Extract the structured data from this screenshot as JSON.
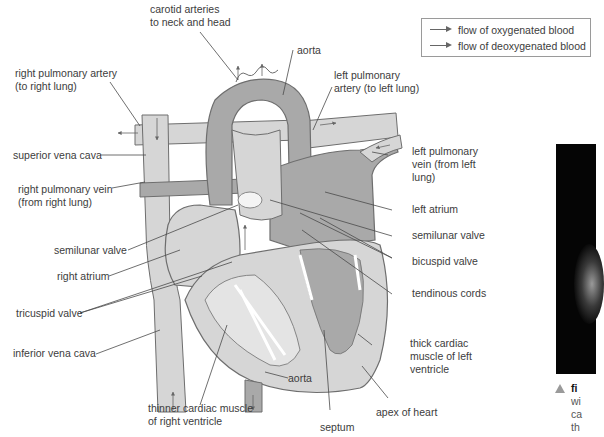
{
  "legend": {
    "items": [
      {
        "label": "flow of oxygenated blood",
        "arrow_color": "#666666"
      },
      {
        "label": "flow of deoxygenated blood",
        "arrow_color": "#666666"
      }
    ]
  },
  "labels": {
    "carotid_arteries": [
      "carotid arteries",
      "to neck and head"
    ],
    "aorta_top": "aorta",
    "right_pulmonary_artery": [
      "right pulmonary artery",
      "(to right lung)"
    ],
    "left_pulmonary_artery": [
      "left pulmonary",
      "artery (to left lung)"
    ],
    "superior_vena_cava": "superior vena cava",
    "right_pulmonary_vein": [
      "right pulmonary vein",
      "(from right lung)"
    ],
    "left_pulmonary_vein": [
      "left pulmonary",
      "vein (from left",
      "lung)"
    ],
    "left_atrium": "left atrium",
    "semilunar_valve_left": "semilunar valve",
    "semilunar_valve_right": "semilunar valve",
    "right_atrium": "right atrium",
    "bicuspid_valve": "bicuspid valve",
    "tricuspid_valve": "tricuspid valve",
    "tendinous_cords": "tendinous cords",
    "inferior_vena_cava": "inferior vena cava",
    "thick_cardiac_muscle": [
      "thick cardiac",
      "muscle of left",
      "ventricle"
    ],
    "aorta_bottom": "aorta",
    "thinner_cardiac_muscle": [
      "thinner cardiac muscle",
      "of right ventricle"
    ],
    "apex_of_heart": "apex of heart",
    "septum": "septum"
  },
  "caption": {
    "lines": [
      "fi",
      "wi",
      "ca",
      "th"
    ]
  },
  "colors": {
    "vessel_light": "#d6d6d6",
    "vessel_dark": "#a9a9a9",
    "chamber_mid": "#bfbfbf",
    "outline": "#6e6e6e",
    "leader_line": "#4a4a4a"
  }
}
